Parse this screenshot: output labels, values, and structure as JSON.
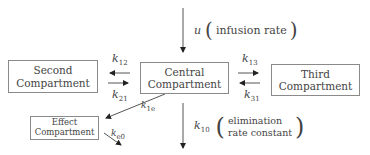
{
  "diagram": {
    "type": "pharmacokinetic multi-compartment model",
    "compartments": {
      "second": {
        "line1": "Second",
        "line2": "Compartment"
      },
      "central": {
        "line1": "Central",
        "line2": "Compartment"
      },
      "third": {
        "line1": "Third",
        "line2": "Compartment"
      },
      "effect": {
        "line1": "Effect",
        "line2": "Compartment"
      }
    },
    "input": {
      "symbol": "u",
      "description": "infusion rate"
    },
    "elimination": {
      "symbol": "k",
      "subscript": "10",
      "line1": "elimination",
      "line2": "rate constant"
    },
    "rate_constants": {
      "k12": {
        "symbol": "k",
        "subscript": "12"
      },
      "k21": {
        "symbol": "k",
        "subscript": "21"
      },
      "k13": {
        "symbol": "k",
        "subscript": "13"
      },
      "k31": {
        "symbol": "k",
        "subscript": "31"
      },
      "k1e": {
        "symbol": "k",
        "subscript": "1e"
      },
      "ke0": {
        "symbol": "k",
        "subscript": "e0"
      }
    },
    "edges": [
      {
        "from": "infusion",
        "to": "central",
        "label": "u"
      },
      {
        "from": "central",
        "to": "second",
        "label": "k12"
      },
      {
        "from": "second",
        "to": "central",
        "label": "k21"
      },
      {
        "from": "central",
        "to": "third",
        "label": "k13"
      },
      {
        "from": "third",
        "to": "central",
        "label": "k31"
      },
      {
        "from": "central",
        "to": "effect",
        "label": "k1e"
      },
      {
        "from": "effect",
        "to": "out",
        "label": "ke0"
      },
      {
        "from": "central",
        "to": "out",
        "label": "k10"
      }
    ],
    "colors": {
      "line": "#555555",
      "box_border": "#8a8a8a",
      "text": "#444444"
    }
  }
}
